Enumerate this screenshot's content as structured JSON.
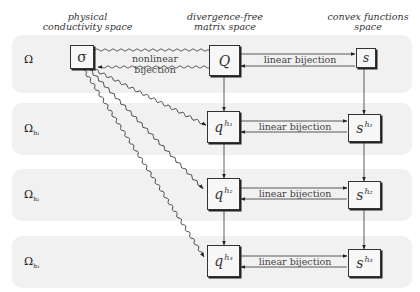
{
  "columns": {
    "physical": "physical\nconductivity space",
    "physical_l1": "physical",
    "physical_l2": "conductivity space",
    "divergence_l1": "divergence-free",
    "divergence_l2": "matrix space",
    "convex_l1": "convex functions",
    "convex_l2": "space"
  },
  "rows": [
    {
      "label": "Ω",
      "sub": ""
    },
    {
      "label": "Ω",
      "sub": "h₁"
    },
    {
      "label": "Ω",
      "sub": "h₂"
    },
    {
      "label": "Ω",
      "sub": "h₃"
    }
  ],
  "nodes": {
    "sigma": "σ",
    "Q": "Q",
    "s": "s",
    "q1_base": "q",
    "q1_sup": "h₁",
    "q2_base": "q",
    "q2_sup": "h₂",
    "q3_base": "q",
    "q3_sup": "h₃",
    "s1_base": "s",
    "s1_sup": "h₁",
    "s2_base": "s",
    "s2_sup": "h₂",
    "s3_base": "s",
    "s3_sup": "h₃"
  },
  "edges": {
    "nonlinear": "nonlinear bijection",
    "linear_0": "linear bijection",
    "linear_1": "linear bijection",
    "linear_2": "linear bijection",
    "linear_3": "linear bijection"
  }
}
